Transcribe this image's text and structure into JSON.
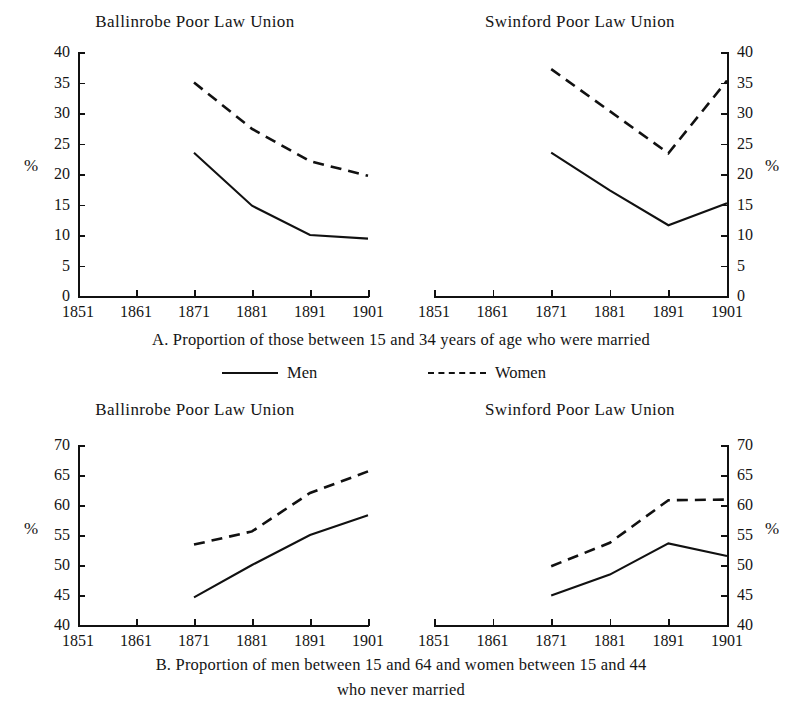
{
  "page": {
    "top_bleed_text": " ",
    "percent_symbol": "%"
  },
  "legend": {
    "men_label": "Men",
    "women_label": "Women"
  },
  "captions": {
    "a": "A. Proportion of those between 15 and 34 years of age who were married",
    "b_line1": "B. Proportion of men between 15 and 64 and women between 15 and 44",
    "b_line2": "who never married"
  },
  "panels": {
    "a_ballinrobe": {
      "title": "Ballinrobe Poor Law Union"
    },
    "a_swinford": {
      "title": "Swinford Poor Law Union"
    },
    "b_ballinrobe": {
      "title": "Ballinrobe Poor Law Union"
    },
    "b_swinford": {
      "title": "Swinford Poor Law Union"
    }
  },
  "axes": {
    "x_ticks": [
      "1851",
      "1861",
      "1871",
      "1881",
      "1891",
      "1901"
    ],
    "y_ticks_a": [
      "40",
      "35",
      "30",
      "25",
      "20",
      "15",
      "10",
      "5",
      "0"
    ],
    "y_ticks_b": [
      "70",
      "65",
      "60",
      "55",
      "50",
      "45",
      "40"
    ]
  },
  "chart_data": [
    {
      "id": "A-Ballinrobe",
      "type": "line",
      "title": "Ballinrobe Poor Law Union",
      "subtitle": "A. Proportion of those between 15 and 34 years of age who were married",
      "xlabel": "",
      "ylabel": "%",
      "x": [
        1851,
        1861,
        1871,
        1881,
        1891,
        1901
      ],
      "xlim": [
        1851,
        1901
      ],
      "ylim": [
        0,
        40
      ],
      "yticks": [
        0,
        5,
        10,
        15,
        20,
        25,
        30,
        35,
        40
      ],
      "grid": false,
      "legend_position": "below-figure",
      "series": [
        {
          "name": "Men",
          "style": "solid",
          "x": [
            1871,
            1881,
            1891,
            1901
          ],
          "values": [
            23.5,
            14.8,
            10.0,
            9.4
          ]
        },
        {
          "name": "Women",
          "style": "dashed",
          "x": [
            1871,
            1881,
            1891,
            1901
          ],
          "values": [
            35.0,
            27.4,
            22.1,
            19.7
          ]
        }
      ]
    },
    {
      "id": "A-Swinford",
      "type": "line",
      "title": "Swinford Poor Law Union",
      "subtitle": "A. Proportion of those between 15 and 34 years of age who were married",
      "xlabel": "",
      "ylabel": "%",
      "x": [
        1851,
        1861,
        1871,
        1881,
        1891,
        1901
      ],
      "xlim": [
        1851,
        1901
      ],
      "ylim": [
        0,
        40
      ],
      "yticks": [
        0,
        5,
        10,
        15,
        20,
        25,
        30,
        35,
        40
      ],
      "grid": false,
      "legend_position": "below-figure",
      "series": [
        {
          "name": "Men",
          "style": "solid",
          "x": [
            1871,
            1881,
            1891,
            1901
          ],
          "values": [
            23.5,
            17.3,
            11.6,
            15.2
          ]
        },
        {
          "name": "Women",
          "style": "dashed",
          "x": [
            1871,
            1881,
            1891,
            1901
          ],
          "values": [
            37.2,
            30.3,
            23.4,
            35.3
          ]
        }
      ]
    },
    {
      "id": "B-Ballinrobe",
      "type": "line",
      "title": "Ballinrobe Poor Law Union",
      "subtitle": "B. Proportion of men between 15 and 64 and women between 15 and 44 who never married",
      "xlabel": "",
      "ylabel": "%",
      "x": [
        1851,
        1861,
        1871,
        1881,
        1891,
        1901
      ],
      "xlim": [
        1851,
        1901
      ],
      "ylim": [
        40,
        70
      ],
      "yticks": [
        40,
        45,
        50,
        55,
        60,
        65,
        70
      ],
      "grid": false,
      "legend_position": "below-figure",
      "series": [
        {
          "name": "Men",
          "style": "solid",
          "x": [
            1871,
            1881,
            1891,
            1901
          ],
          "values": [
            44.6,
            50.0,
            55.0,
            58.3
          ]
        },
        {
          "name": "Women",
          "style": "dashed",
          "x": [
            1871,
            1881,
            1891,
            1901
          ],
          "values": [
            53.4,
            55.6,
            62.0,
            65.6
          ]
        }
      ]
    },
    {
      "id": "B-Swinford",
      "type": "line",
      "title": "Swinford Poor Law Union",
      "subtitle": "B. Proportion of men between 15 and 64 and women between 15 and 44 who never married",
      "xlabel": "",
      "ylabel": "%",
      "x": [
        1851,
        1861,
        1871,
        1881,
        1891,
        1901
      ],
      "xlim": [
        1851,
        1901
      ],
      "ylim": [
        40,
        70
      ],
      "yticks": [
        40,
        45,
        50,
        55,
        60,
        65,
        70
      ],
      "grid": false,
      "legend_position": "below-figure",
      "series": [
        {
          "name": "Men",
          "style": "solid",
          "x": [
            1871,
            1881,
            1891,
            1901
          ],
          "values": [
            44.9,
            48.4,
            53.6,
            51.5
          ]
        },
        {
          "name": "Women",
          "style": "dashed",
          "x": [
            1871,
            1881,
            1891,
            1901
          ],
          "values": [
            49.8,
            53.7,
            60.8,
            60.9
          ]
        }
      ]
    }
  ]
}
